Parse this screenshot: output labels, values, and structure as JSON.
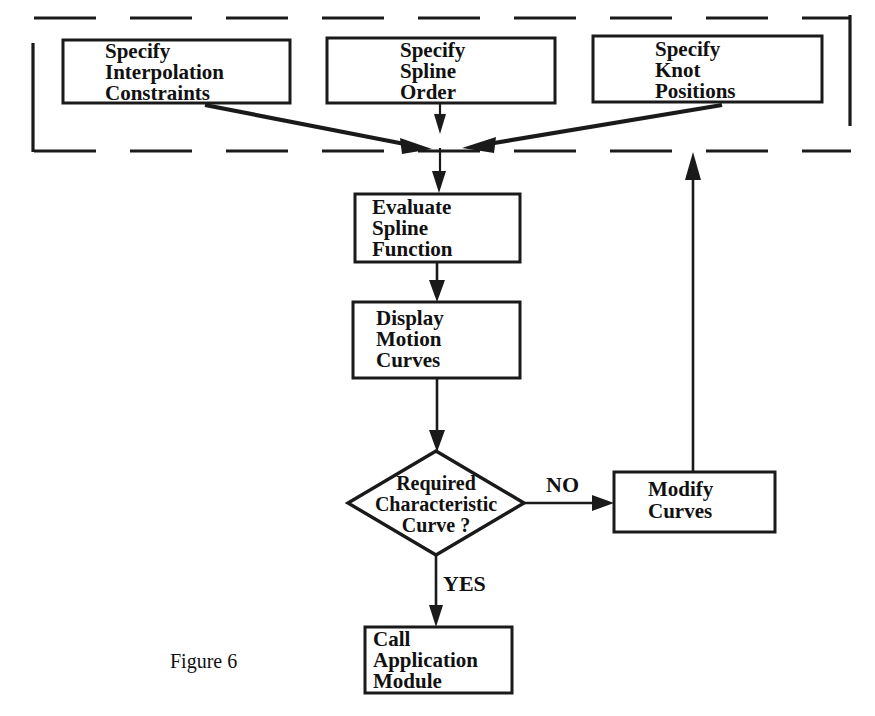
{
  "figure": {
    "caption": "Figure 6",
    "caption_x": 170,
    "caption_y": 663
  },
  "colors": {
    "stroke": "#1a1a1a",
    "text": "#111111",
    "background": "#ffffff"
  },
  "group_box": {
    "name": "specification-group",
    "left": 32,
    "top": 18,
    "right": 851,
    "bottom": 151,
    "style": "dashed"
  },
  "nodes": [
    {
      "id": "specify-interpolation-constraints",
      "shape": "process",
      "lines": [
        "Specify",
        "Interpolation",
        "Constraints"
      ],
      "x": 63,
      "y": 40,
      "width": 227,
      "height": 63,
      "text_x": 105,
      "text_start_y": 53
    },
    {
      "id": "specify-spline-order",
      "shape": "process",
      "lines": [
        "Specify",
        "Spline",
        "Order"
      ],
      "x": 327,
      "y": 38,
      "width": 228,
      "height": 65,
      "text_x": 400,
      "text_start_y": 52
    },
    {
      "id": "specify-knot-positions",
      "shape": "process",
      "lines": [
        "Specify",
        "Knot",
        "Positions"
      ],
      "x": 593,
      "y": 36,
      "width": 229,
      "height": 66,
      "text_x": 655,
      "text_start_y": 51
    },
    {
      "id": "evaluate-spline-function",
      "shape": "process",
      "lines": [
        "Evaluate",
        "Spline",
        "Function"
      ],
      "x": 355,
      "y": 194,
      "width": 165,
      "height": 68,
      "text_x": 372,
      "text_start_y": 209
    },
    {
      "id": "display-motion-curves",
      "shape": "process",
      "lines": [
        "Display",
        "Motion",
        "Curves"
      ],
      "x": 353,
      "y": 302,
      "width": 167,
      "height": 76,
      "text_x": 376,
      "text_start_y": 320
    },
    {
      "id": "modify-curves",
      "shape": "process",
      "lines": [
        "Modify",
        "Curves"
      ],
      "x": 614,
      "y": 472,
      "width": 161,
      "height": 60,
      "text_x": 648,
      "text_start_y": 491
    },
    {
      "id": "call-application-module",
      "shape": "process",
      "lines": [
        "Call",
        "Application",
        "Module"
      ],
      "x": 365,
      "y": 627,
      "width": 147,
      "height": 66,
      "text_x": 373,
      "text_start_y": 641
    }
  ],
  "decision": {
    "id": "required-characteristic-curve",
    "shape": "decision",
    "lines": [
      "Required",
      "Characteristic",
      "Curve  ?"
    ],
    "center_x": 436,
    "center_y": 503,
    "half_width": 88,
    "half_height": 52,
    "text_start_y": 485
  },
  "edge_labels": [
    {
      "id": "label-no",
      "text": "NO",
      "x": 546,
      "y": 487
    },
    {
      "id": "label-yes",
      "text": "YES",
      "x": 443,
      "y": 586
    }
  ],
  "edges": [
    {
      "id": "constraints-to-junction",
      "from": "specify-interpolation-constraints",
      "to": "merge-junction",
      "style": "diagonal-arrow"
    },
    {
      "id": "spline-order-to-junction",
      "from": "specify-spline-order",
      "to": "merge-junction",
      "style": "vertical-arrow"
    },
    {
      "id": "knot-positions-to-junction",
      "from": "specify-knot-positions",
      "to": "merge-junction",
      "style": "diagonal-arrow"
    },
    {
      "id": "junction-to-evaluate",
      "from": "merge-junction",
      "to": "evaluate-spline-function",
      "style": "vertical-arrow"
    },
    {
      "id": "evaluate-to-display",
      "from": "evaluate-spline-function",
      "to": "display-motion-curves",
      "style": "vertical-arrow"
    },
    {
      "id": "display-to-decision",
      "from": "display-motion-curves",
      "to": "required-characteristic-curve",
      "style": "vertical-arrow"
    },
    {
      "id": "decision-no-to-modify",
      "from": "required-characteristic-curve",
      "to": "modify-curves",
      "label": "NO",
      "style": "horizontal-arrow"
    },
    {
      "id": "decision-yes-to-call",
      "from": "required-characteristic-curve",
      "to": "call-application-module",
      "label": "YES",
      "style": "vertical-arrow"
    },
    {
      "id": "modify-to-group",
      "from": "modify-curves",
      "to": "specification-group",
      "style": "feedback-arrow"
    }
  ]
}
